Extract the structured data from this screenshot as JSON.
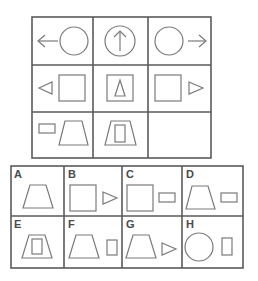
{
  "puzzle": {
    "matrix": {
      "rows": 3,
      "cols": 3,
      "cells": [
        {
          "row": 0,
          "col": 0,
          "shapes": [
            "arrow-left",
            "circle"
          ]
        },
        {
          "row": 0,
          "col": 1,
          "shapes": [
            "circle-with-arrow-up"
          ]
        },
        {
          "row": 0,
          "col": 2,
          "shapes": [
            "circle",
            "arrow-right"
          ]
        },
        {
          "row": 1,
          "col": 0,
          "shapes": [
            "triangle-left",
            "square"
          ]
        },
        {
          "row": 1,
          "col": 1,
          "shapes": [
            "square-with-triangle-up"
          ]
        },
        {
          "row": 1,
          "col": 2,
          "shapes": [
            "square",
            "triangle-right"
          ]
        },
        {
          "row": 2,
          "col": 0,
          "shapes": [
            "small-rectangle",
            "trapezoid"
          ]
        },
        {
          "row": 2,
          "col": 1,
          "shapes": [
            "trapezoid-with-rectangle"
          ]
        },
        {
          "row": 2,
          "col": 2,
          "shapes": [],
          "missing": true
        }
      ]
    },
    "options": [
      {
        "label": "A",
        "shapes": [
          "trapezoid"
        ]
      },
      {
        "label": "B",
        "shapes": [
          "square",
          "triangle-right"
        ]
      },
      {
        "label": "C",
        "shapes": [
          "square",
          "small-rectangle"
        ]
      },
      {
        "label": "D",
        "shapes": [
          "trapezoid",
          "small-rectangle"
        ]
      },
      {
        "label": "E",
        "shapes": [
          "trapezoid-with-rectangle"
        ]
      },
      {
        "label": "F",
        "shapes": [
          "trapezoid",
          "vertical-rectangle"
        ]
      },
      {
        "label": "G",
        "shapes": [
          "trapezoid",
          "triangle-right"
        ]
      },
      {
        "label": "H",
        "shapes": [
          "circle",
          "vertical-rectangle"
        ]
      }
    ],
    "colors": {
      "line": "#6e6e6e",
      "border": "#5a5a5a",
      "label": "#4a4a4a"
    }
  }
}
